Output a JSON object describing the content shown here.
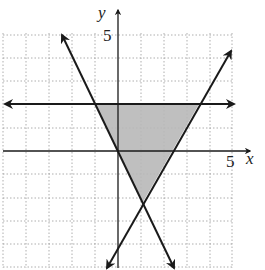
{
  "figure": {
    "x_axis_label": "x",
    "y_axis_label": "y",
    "x_tick_label": "5",
    "y_tick_label": "5",
    "grid": {
      "x_min": -5,
      "x_max": 5,
      "y_min": -5,
      "y_max": 5,
      "step": 1
    },
    "lines": [
      {
        "name": "horizontal-line",
        "description": "y = 2",
        "arrows": "both"
      },
      {
        "name": "decreasing-line",
        "description": "line through origin, slope -2",
        "arrows": "both"
      },
      {
        "name": "increasing-line",
        "description": "line with positive slope through (1,-2)",
        "arrows": "both"
      }
    ],
    "shaded_region": {
      "shape": "triangle",
      "vertices": [
        [
          -1,
          2
        ],
        [
          3.5,
          2
        ],
        [
          1,
          -2
        ]
      ],
      "color": "#b8b8b8"
    },
    "colors": {
      "line": "#1a1a1a",
      "grid": "#9a9a9a",
      "shade": "#b8b8b8"
    }
  }
}
